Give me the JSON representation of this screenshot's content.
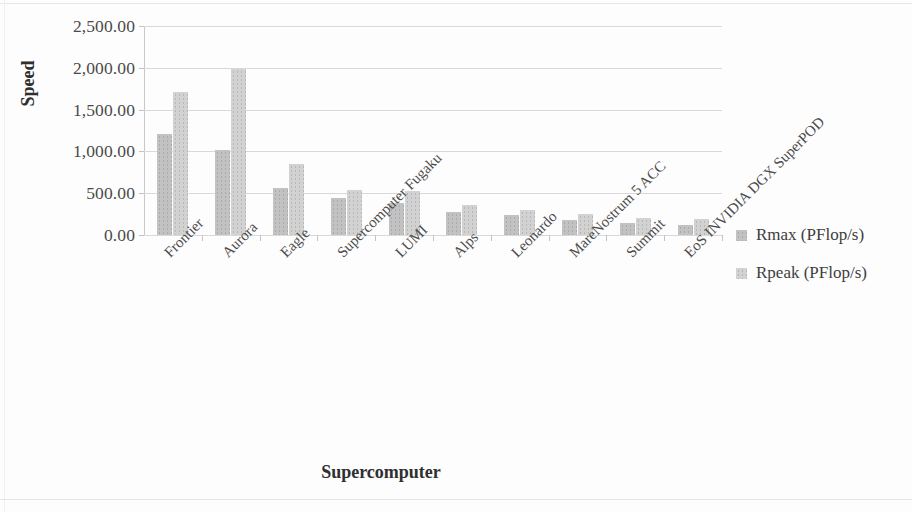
{
  "chart_data": {
    "type": "bar",
    "title": "",
    "xlabel": "Supercomputer",
    "ylabel": "Speed",
    "ylim": [
      0,
      2500
    ],
    "yticks": [
      0,
      500,
      1000,
      1500,
      2000,
      2500
    ],
    "ytick_labels": [
      "0.00",
      "500.00",
      "1,000.00",
      "1,500.00",
      "2,000.00",
      "2,500.00"
    ],
    "grid": true,
    "legend_position": "right",
    "categories": [
      "Frontier",
      "Aurora",
      "Eagle",
      "Supercomputer Fugaku",
      "LUMI",
      "Alps",
      "Leonardo",
      "MareNostrum 5 ACC",
      "Summit",
      "EoS INVIDIA DGX SuperPOD"
    ],
    "series": [
      {
        "name": "Rmax (PFlop/s)",
        "color": "#c2c2c2",
        "values": [
          1206.0,
          1012.0,
          561.2,
          442.01,
          379.7,
          270.0,
          238.7,
          175.3,
          148.6,
          121.4
        ]
      },
      {
        "name": "Rpeak (PFlop/s)",
        "color": "#d2d2d2",
        "values": [
          1714.81,
          1980.01,
          846.84,
          537.21,
          531.51,
          353.75,
          304.47,
          249.44,
          200.79,
          188.65
        ]
      }
    ]
  },
  "legend": {
    "items": [
      {
        "label": "Rmax (PFlop/s)",
        "color": "#c2c2c2"
      },
      {
        "label": "Rpeak (PFlop/s)",
        "color": "#d2d2d2"
      }
    ]
  }
}
